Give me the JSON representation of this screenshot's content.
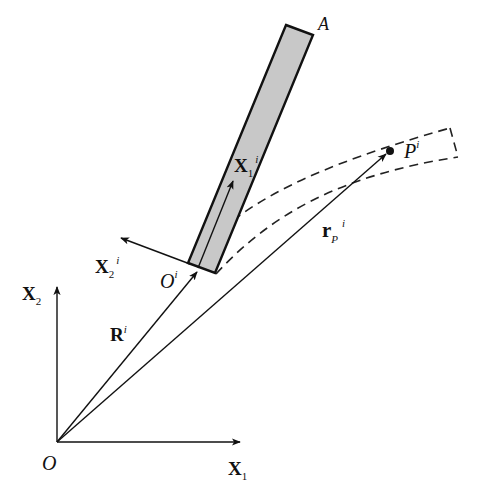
{
  "diagram": {
    "colors": {
      "line": "#111111",
      "rod_fill": "#c8c8c8",
      "background": "#ffffff"
    },
    "labels": {
      "origin": "O",
      "global_x1": {
        "base": "X",
        "sub": "1"
      },
      "global_x2": {
        "base": "X",
        "sub": "2"
      },
      "body_end": "A",
      "local_origin": {
        "base": "O",
        "sup": "i"
      },
      "local_x1": {
        "base": "X",
        "sub": "1",
        "sup": "i"
      },
      "local_x2": {
        "base": "X",
        "sub": "2",
        "sup": "i"
      },
      "position_vector": {
        "base": "R",
        "sup": "i"
      },
      "point_vector": {
        "base": "r",
        "sub": "P",
        "sup": "i"
      },
      "point": {
        "base": "P",
        "sup": "i"
      }
    },
    "elements": {
      "rigid_body": "shaded rod from O^i to A",
      "deformed_path": "dashed curved strip through P^i",
      "icons": [
        "arrow-icon",
        "point-marker-icon"
      ]
    }
  }
}
